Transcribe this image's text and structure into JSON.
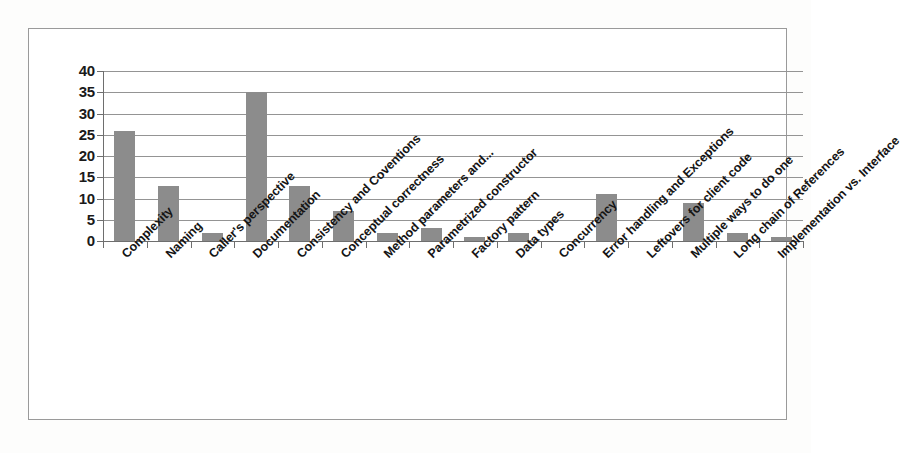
{
  "chart_data": {
    "type": "bar",
    "title": "",
    "xlabel": "",
    "ylabel": "",
    "ylim": [
      0,
      40
    ],
    "y_ticks": [
      0,
      5,
      10,
      15,
      20,
      25,
      30,
      35,
      40
    ],
    "grid": true,
    "legend": "none",
    "bar_color": "#8c8c8c",
    "categories": [
      "Complexity",
      "Naming",
      "Caller's perspective",
      "Documentation",
      "Consistency and Coventions",
      "Conceptual correctness",
      "Method parameters and...",
      "Parametrized constructor",
      "Factory pattern",
      "Data types",
      "Concurrency",
      "Error handling and Exceptions",
      "Leftovers for client code",
      "Multiple ways to do one",
      "Long chain of References",
      "Implementation vs. Interface"
    ],
    "values": [
      26,
      13,
      2,
      35,
      13,
      7,
      2,
      3,
      1,
      2,
      0,
      11,
      0,
      9,
      2,
      1
    ]
  },
  "axis": {
    "y_tick_labels": [
      "40",
      "35",
      "30",
      "25",
      "20",
      "15",
      "10",
      "5",
      "0"
    ]
  }
}
